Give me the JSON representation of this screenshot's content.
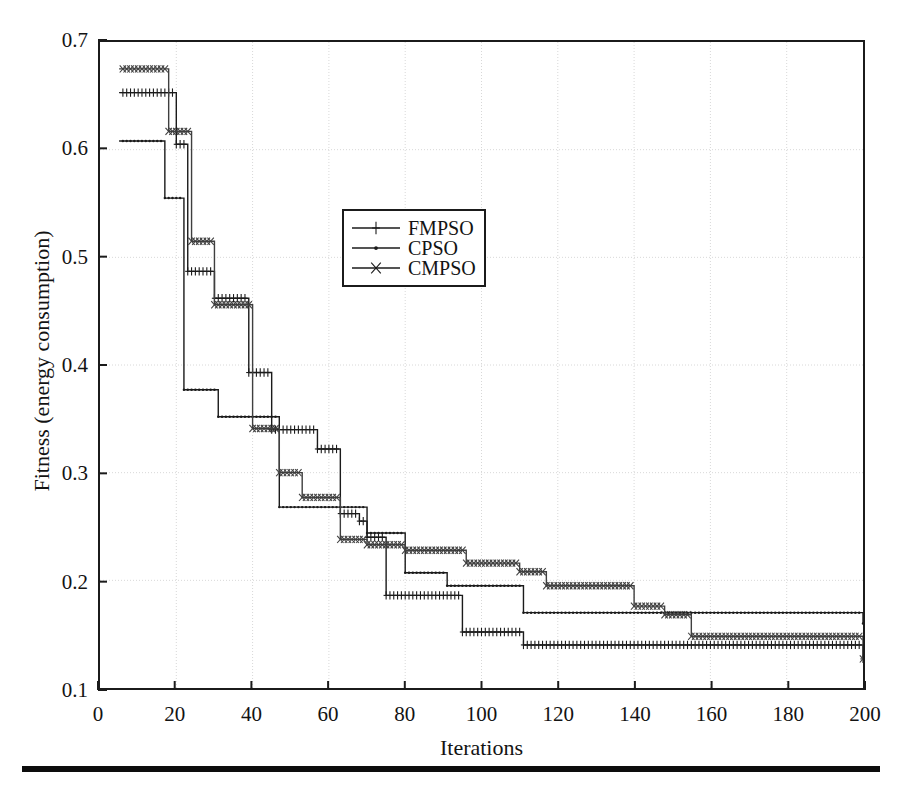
{
  "figure": {
    "bottom_rule_visible": true,
    "background": "#ffffff"
  },
  "chart_data": {
    "type": "line",
    "title": "",
    "xlabel": "Iterations",
    "ylabel": "Fitness (energy consumption)",
    "xlim": [
      0,
      200
    ],
    "ylim": [
      0.1,
      0.7
    ],
    "xticks": [
      0,
      20,
      40,
      60,
      80,
      100,
      120,
      140,
      160,
      180,
      200
    ],
    "xtick_labels": [
      "0",
      "20",
      "40",
      "60",
      "80",
      "100",
      "120",
      "140",
      "160",
      "180",
      "200"
    ],
    "yticks": [
      0.1,
      0.2,
      0.3,
      0.4,
      0.5,
      0.6,
      0.7
    ],
    "ytick_labels": [
      "0.1",
      "0.2",
      "0.3",
      "0.4",
      "0.5",
      "0.6",
      "0.7"
    ],
    "grid": true,
    "grid_color": "#d8d8d8",
    "grid_style": "dotted",
    "legend_position": "upper-center",
    "line_color": "#1b1b1b",
    "step_style": "post",
    "series": [
      {
        "name": "FMPSO",
        "marker": "plus",
        "color": "#1b1b1b",
        "x": [
          5,
          15,
          20,
          23,
          28,
          30,
          39,
          43,
          45,
          57,
          60,
          63,
          68,
          70,
          75,
          78,
          95,
          97,
          111,
          200
        ],
        "values": [
          0.653,
          0.653,
          0.605,
          0.487,
          0.487,
          0.462,
          0.393,
          0.393,
          0.34,
          0.322,
          0.322,
          0.262,
          0.255,
          0.24,
          0.186,
          0.186,
          0.152,
          0.152,
          0.14,
          0.127
        ]
      },
      {
        "name": "CPSO",
        "marker": "dot",
        "color": "#1b1b1b",
        "x": [
          5,
          14,
          17,
          20,
          22,
          30,
          31,
          45,
          47,
          52,
          70,
          72,
          80,
          82,
          91,
          93,
          111,
          113,
          200
        ],
        "values": [
          0.608,
          0.608,
          0.555,
          0.555,
          0.377,
          0.377,
          0.352,
          0.352,
          0.268,
          0.268,
          0.244,
          0.244,
          0.207,
          0.207,
          0.195,
          0.195,
          0.17,
          0.17,
          0.16
        ]
      },
      {
        "name": "CMPSO",
        "marker": "cross",
        "color": "#3f3f3f",
        "x": [
          5,
          15,
          18,
          21,
          24,
          27,
          30,
          36,
          40,
          44,
          47,
          50,
          53,
          57,
          63,
          66,
          70,
          75,
          80,
          92,
          96,
          105,
          110,
          113,
          117,
          140,
          145,
          148,
          155,
          160,
          200
        ],
        "values": [
          0.675,
          0.675,
          0.617,
          0.617,
          0.515,
          0.515,
          0.456,
          0.456,
          0.341,
          0.341,
          0.3,
          0.3,
          0.277,
          0.277,
          0.238,
          0.238,
          0.233,
          0.233,
          0.228,
          0.228,
          0.216,
          0.216,
          0.208,
          0.208,
          0.195,
          0.176,
          0.176,
          0.168,
          0.148,
          0.148,
          0.127
        ]
      }
    ]
  },
  "legend": {
    "items": [
      {
        "label": "FMPSO",
        "marker": "plus"
      },
      {
        "label": "CPSO",
        "marker": "dot"
      },
      {
        "label": "CMPSO",
        "marker": "cross"
      }
    ]
  }
}
